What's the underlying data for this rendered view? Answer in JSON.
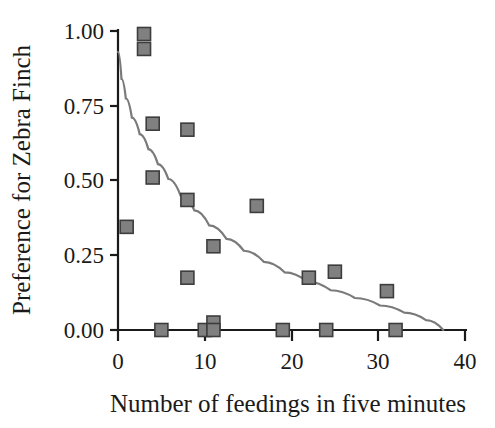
{
  "figure": {
    "background_color": "#ffffff",
    "marker_fill_color": "#808080",
    "marker_edge_color": "#3d3d3d",
    "curve_color": "#7a7a7a",
    "axis_color": "#1a1a1a"
  },
  "chart_data": {
    "type": "scatter",
    "title": "",
    "xlabel": "Number of feedings in five minutes",
    "ylabel": "Preference for Zebra Finch",
    "xlim": [
      0,
      40
    ],
    "ylim": [
      0.0,
      1.0
    ],
    "xticks": [
      0,
      10,
      20,
      30,
      40
    ],
    "xtick_labels": [
      "0",
      "10",
      "20",
      "30",
      "40"
    ],
    "yticks": [
      0.0,
      0.25,
      0.5,
      0.75,
      1.0
    ],
    "ytick_labels": [
      "0.00",
      "0.25",
      "0.50",
      "0.75",
      "1.00"
    ],
    "grid": false,
    "legend": false,
    "legend_position": "none",
    "series": [
      {
        "name": "Observations",
        "type": "scatter",
        "marker": "square",
        "points": [
          {
            "x": 1,
            "y": 0.345
          },
          {
            "x": 3,
            "y": 0.99
          },
          {
            "x": 3,
            "y": 0.94
          },
          {
            "x": 4,
            "y": 0.69
          },
          {
            "x": 4,
            "y": 0.51
          },
          {
            "x": 5,
            "y": 0.0
          },
          {
            "x": 8,
            "y": 0.67
          },
          {
            "x": 8,
            "y": 0.435
          },
          {
            "x": 8,
            "y": 0.175
          },
          {
            "x": 10,
            "y": 0.0
          },
          {
            "x": 11,
            "y": 0.28
          },
          {
            "x": 11,
            "y": 0.025
          },
          {
            "x": 11,
            "y": 0.0
          },
          {
            "x": 16,
            "y": 0.415
          },
          {
            "x": 19,
            "y": 0.0
          },
          {
            "x": 22,
            "y": 0.175
          },
          {
            "x": 24,
            "y": 0.0
          },
          {
            "x": 25,
            "y": 0.195
          },
          {
            "x": 31,
            "y": 0.13
          },
          {
            "x": 32,
            "y": 0.0
          }
        ]
      },
      {
        "name": "Fitted decay curve",
        "type": "line",
        "points": [
          {
            "x": 0.0,
            "y": 0.93
          },
          {
            "x": 0.4,
            "y": 0.84
          },
          {
            "x": 0.9,
            "y": 0.775
          },
          {
            "x": 1.6,
            "y": 0.71
          },
          {
            "x": 2.5,
            "y": 0.655
          },
          {
            "x": 3.5,
            "y": 0.605
          },
          {
            "x": 4.6,
            "y": 0.555
          },
          {
            "x": 5.8,
            "y": 0.505
          },
          {
            "x": 7.2,
            "y": 0.45
          },
          {
            "x": 8.8,
            "y": 0.4
          },
          {
            "x": 10.5,
            "y": 0.35
          },
          {
            "x": 12.5,
            "y": 0.305
          },
          {
            "x": 14.5,
            "y": 0.265
          },
          {
            "x": 16.8,
            "y": 0.228
          },
          {
            "x": 19.2,
            "y": 0.193
          },
          {
            "x": 21.8,
            "y": 0.162
          },
          {
            "x": 24.5,
            "y": 0.133
          },
          {
            "x": 27.3,
            "y": 0.107
          },
          {
            "x": 30.2,
            "y": 0.082
          },
          {
            "x": 33.0,
            "y": 0.058
          },
          {
            "x": 35.5,
            "y": 0.033
          },
          {
            "x": 37.5,
            "y": 0.0
          }
        ]
      }
    ]
  }
}
